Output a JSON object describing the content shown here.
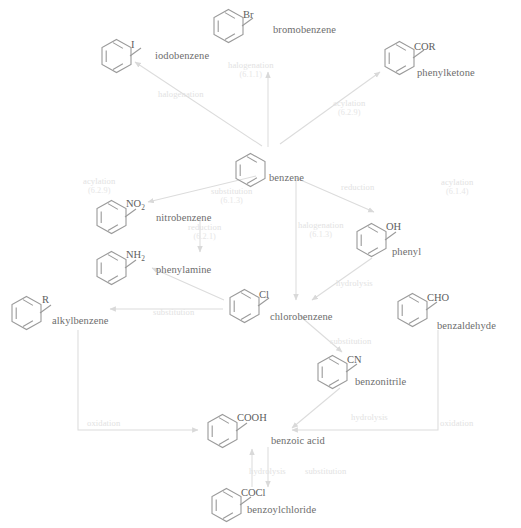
{
  "diagram": {
    "palette": {
      "ring_stroke": "#9a9a9a",
      "arrow_stroke": "#d5d5d5",
      "compound_text": "#6d6d6d",
      "reaction_text": "#e2e2e2",
      "background": "#ffffff"
    },
    "compounds": [
      {
        "id": "bromobenzene",
        "name": "bromobenzene",
        "substituent": "Br",
        "ring_x": 212,
        "ring_y": 8,
        "sub_x": 243,
        "sub_y": 9,
        "label_x": 273,
        "label_y": 24
      },
      {
        "id": "iodobenzene",
        "name": "iodobenzene",
        "substituent": "I",
        "ring_x": 100,
        "ring_y": 38,
        "sub_x": 131,
        "sub_y": 39,
        "label_x": 155,
        "label_y": 50
      },
      {
        "id": "phenylketone",
        "name": "phenylketone",
        "substituent": "COR",
        "ring_x": 383,
        "ring_y": 40,
        "sub_x": 414,
        "sub_y": 41,
        "label_x": 417,
        "label_y": 67
      },
      {
        "id": "benzene",
        "name": "benzene",
        "substituent": "",
        "ring_x": 234,
        "ring_y": 152,
        "sub_x": 0,
        "sub_y": 0,
        "label_x": 269,
        "label_y": 172
      },
      {
        "id": "nitrobenzene",
        "name": "nitrobenzene",
        "substituent": "NO2",
        "ring_x": 95,
        "ring_y": 199,
        "sub_x": 126,
        "sub_y": 198,
        "label_x": 156,
        "label_y": 212
      },
      {
        "id": "phenylamine",
        "name": "phenylamine",
        "substituent": "NH2",
        "ring_x": 95,
        "ring_y": 250,
        "sub_x": 126,
        "sub_y": 249,
        "label_x": 156,
        "label_y": 264
      },
      {
        "id": "phenyl",
        "name": "phenyl",
        "substituent": "OH",
        "ring_x": 355,
        "ring_y": 222,
        "sub_x": 386,
        "sub_y": 221,
        "label_x": 392,
        "label_y": 246
      },
      {
        "id": "alkylbenzene",
        "name": "alkylbenzene",
        "substituent": "R",
        "ring_x": 10,
        "ring_y": 295,
        "sub_x": 42,
        "sub_y": 294,
        "label_x": 52,
        "label_y": 315
      },
      {
        "id": "chlorobenzene",
        "name": "chlorobenzene",
        "substituent": "Cl",
        "ring_x": 228,
        "ring_y": 288,
        "sub_x": 259,
        "sub_y": 289,
        "label_x": 270,
        "label_y": 311
      },
      {
        "id": "benzaldehyde",
        "name": "benzaldehyde",
        "substituent": "CHO",
        "ring_x": 396,
        "ring_y": 292,
        "sub_x": 427,
        "sub_y": 292,
        "label_x": 437,
        "label_y": 320
      },
      {
        "id": "benzonitrile",
        "name": "benzonitrile",
        "substituent": "CN",
        "ring_x": 316,
        "ring_y": 354,
        "sub_x": 347,
        "sub_y": 354,
        "label_x": 355,
        "label_y": 376
      },
      {
        "id": "benzoic-acid",
        "name": "benzoic acid",
        "substituent": "COOH",
        "ring_x": 206,
        "ring_y": 413,
        "sub_x": 237,
        "sub_y": 412,
        "label_x": 271,
        "label_y": 435
      },
      {
        "id": "benzoylchloride",
        "name": "benzoylchloride",
        "substituent": "COCl",
        "ring_x": 210,
        "ring_y": 487,
        "sub_x": 241,
        "sub_y": 487,
        "label_x": 247,
        "label_y": 504
      }
    ],
    "reactions": [
      {
        "id": "halogenation-br",
        "label": "halogenation",
        "code": "(6.1.1)",
        "x": 228,
        "y": 60
      },
      {
        "id": "halogenation-i",
        "label": "halogenation",
        "code": "",
        "x": 158,
        "y": 89
      },
      {
        "id": "acylation-ketone",
        "label": "acylation",
        "code": "(6.2.9)",
        "x": 333,
        "y": 98
      },
      {
        "id": "acylation-nitro",
        "label": "acylation",
        "code": "(6.2.9)",
        "x": 83,
        "y": 176
      },
      {
        "id": "substitution-nitro",
        "label": "substitution",
        "code": "(6.1.3)",
        "x": 211,
        "y": 186
      },
      {
        "id": "reduction-amine",
        "label": "reduction",
        "code": "(6.2.1)",
        "x": 188,
        "y": 222
      },
      {
        "id": "reduction-phenyl",
        "label": "reduction",
        "code": "",
        "x": 341,
        "y": 182
      },
      {
        "id": "acylation-right",
        "label": "acylation",
        "code": "(6.1.4)",
        "x": 441,
        "y": 177
      },
      {
        "id": "halogenation-cl",
        "label": "halogenation",
        "code": "(6.1.3)",
        "x": 298,
        "y": 220
      },
      {
        "id": "hydrolysis-phenyl",
        "label": "hydrolysis",
        "code": "",
        "x": 336,
        "y": 278
      },
      {
        "id": "substitution-alkyl",
        "label": "substitution",
        "code": "",
        "x": 153,
        "y": 307
      },
      {
        "id": "substitution-cn",
        "label": "substitution",
        "code": "",
        "x": 330,
        "y": 336
      },
      {
        "id": "hydrolysis-cn",
        "label": "hydrolysis",
        "code": "",
        "x": 351,
        "y": 412
      },
      {
        "id": "oxidation-left",
        "label": "oxidation",
        "code": "",
        "x": 87,
        "y": 418
      },
      {
        "id": "oxidation-right",
        "label": "oxidation",
        "code": "",
        "x": 440,
        "y": 418
      },
      {
        "id": "hydrolysis-acyl",
        "label": "hydrolysis",
        "code": "",
        "x": 249,
        "y": 466
      },
      {
        "id": "substitution-acyl",
        "label": "substitution",
        "code": "",
        "x": 305,
        "y": 466
      }
    ]
  }
}
